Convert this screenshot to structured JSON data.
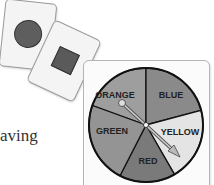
{
  "text": {
    "partial_word": "aving"
  },
  "cards": [
    {
      "shape": "circle",
      "color": "#5e5e5e"
    },
    {
      "shape": "square",
      "color": "#5a5a5a"
    }
  ],
  "spinner": {
    "sections": [
      {
        "label": "ORANGE",
        "color": "#9e9e9e"
      },
      {
        "label": "BLUE",
        "color": "#8a8a8a"
      },
      {
        "label": "YELLOW",
        "color": "#e4e4e4"
      },
      {
        "label": "RED",
        "color": "#7a7a7a"
      },
      {
        "label": "GREEN",
        "color": "#949494"
      }
    ],
    "arrow_points_to": "YELLOW"
  }
}
